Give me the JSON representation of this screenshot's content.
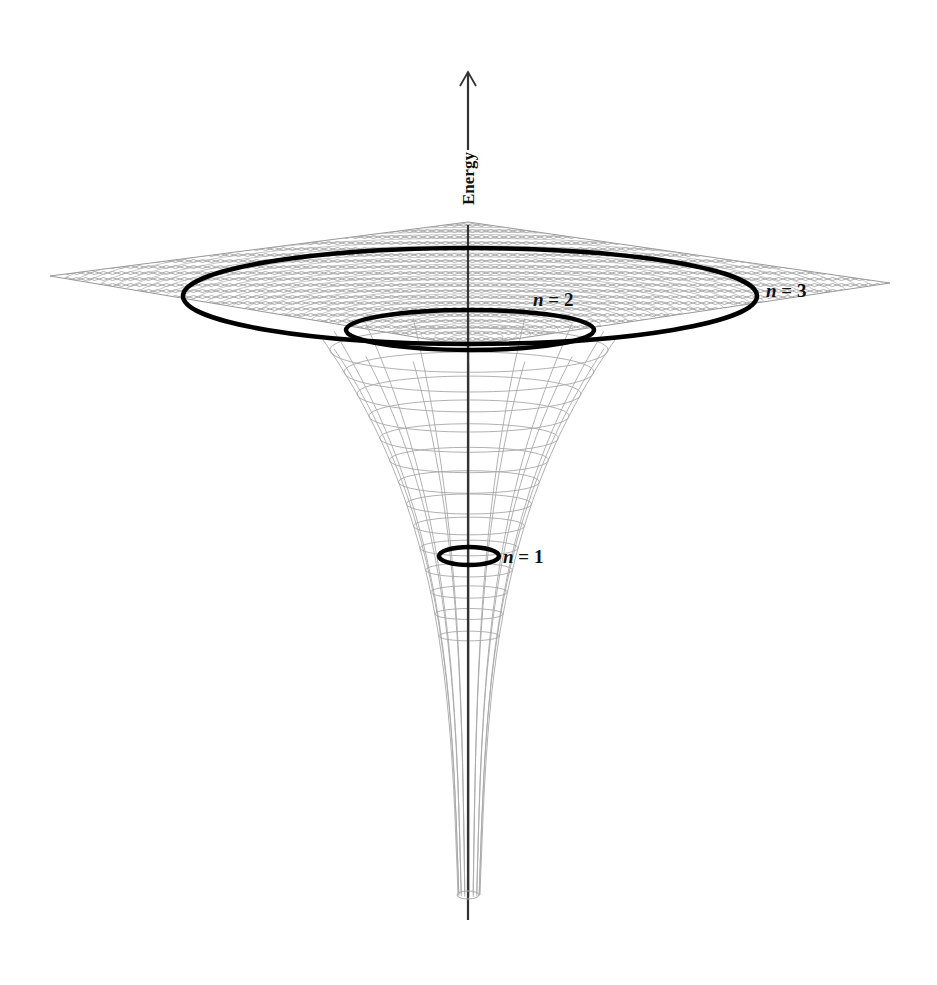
{
  "figure": {
    "axis_label": "Energy",
    "orbit_labels": [
      {
        "n": "n",
        "eq": " = 1"
      },
      {
        "n": "n",
        "eq": " = 2"
      },
      {
        "n": "n",
        "eq": " = 3"
      }
    ]
  },
  "colors": {
    "mesh": "#a8a8a8",
    "orbit": "#000000",
    "axis": "#333333",
    "background": "#ffffff"
  }
}
